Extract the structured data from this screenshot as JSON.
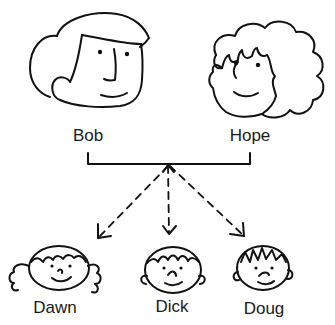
{
  "diagram": {
    "type": "family-tree",
    "parents": [
      {
        "name": "Bob",
        "face": "male-parent"
      },
      {
        "name": "Hope",
        "face": "female-parent-curly"
      }
    ],
    "children": [
      {
        "name": "Dawn",
        "face": "girl-curly"
      },
      {
        "name": "Dick",
        "face": "boy-smiling"
      },
      {
        "name": "Doug",
        "face": "boy-spiky"
      }
    ],
    "connector": "bracket-with-dashed-arrows",
    "ink_color": "#111111",
    "background": "#ffffff"
  }
}
